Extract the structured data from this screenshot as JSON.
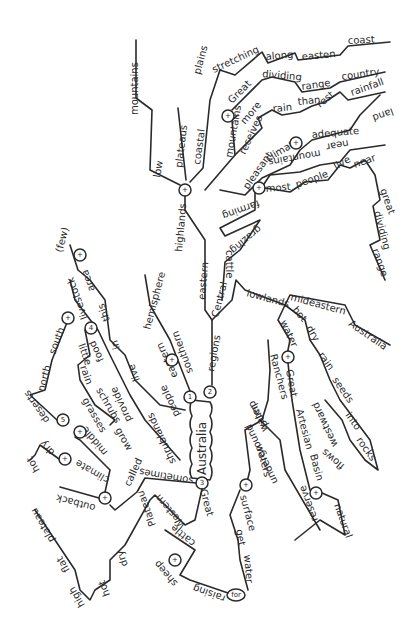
{
  "center": "Australia",
  "branches": {
    "b1": {
      "node": "1",
      "words": [
        "eastern",
        "southern",
        "hemisphere",
        "people",
        "live",
        "in",
        "this",
        "area",
        "(few)",
        "shrublands",
        "provide",
        "food",
        "livestock",
        "little",
        "rain",
        "grasses",
        "schrubs",
        "grow"
      ]
    },
    "b2": {
      "node": "2",
      "words": [
        "regions",
        "eastern",
        "highlands",
        "low",
        "mountains",
        "plateaus",
        "coastal",
        "mountains",
        "plains",
        "stretching",
        "along",
        "easten",
        "coast",
        "Great",
        "dividing",
        "range",
        "receives",
        "more",
        "rain",
        "than",
        "rest",
        "country",
        "pleasant",
        "climate",
        "adequate",
        "rainfall",
        "land",
        "near",
        "mountains",
        "most",
        "people",
        "live",
        "near",
        "great",
        "dividing",
        "range",
        "farming",
        "grazing",
        "cattle",
        "Central",
        "lowlands",
        "mideastern",
        "Australia",
        "hot",
        "dry",
        "rain",
        "seeds",
        "into",
        "rocks",
        "flows",
        "westward",
        "water",
        "Great",
        "Artesian",
        "Basin",
        "natural",
        "reserve",
        "underground",
        "water",
        "Ranchers",
        "pump",
        "waters",
        "surface",
        "get",
        "water",
        "for"
      ]
    },
    "b3": {
      "node": "3",
      "words": [
        "sometimes",
        "called",
        "outback",
        "climate",
        "middle",
        "hot",
        "dry",
        "deserts",
        "north",
        "south",
        "Great",
        "Western",
        "Plateau",
        "dry",
        "hot",
        "high",
        "flat",
        "plateau",
        "cattle",
        "sheep",
        "raising"
      ]
    }
  },
  "labels": {
    "australia": "Australia",
    "eastern1": "eastern",
    "southern": "southern",
    "hemisphere": "hemisphere",
    "people": "people",
    "live1": "live",
    "in": "in",
    "this": "this",
    "area": "area",
    "few": "(few)",
    "shrublands": "shrublands",
    "provide": "provide",
    "food": "food",
    "livestock": "livestock",
    "little": "little",
    "rain1": "rain",
    "grasses": "grasses",
    "schrubs": "schrubs",
    "grow": "grow",
    "north": "north",
    "south": "south",
    "deserts": "deserts",
    "middle": "middle",
    "climate1": "climate",
    "hot1": "hot",
    "dry1": "dry",
    "outback": "outback",
    "called": "called",
    "sometimes": "sometimes",
    "regions": "regions",
    "eastern2": "eastern",
    "highlands": "highlands",
    "low": "low",
    "mountains1": "mountains",
    "plateaus": "plateaus",
    "coastal": "coastal",
    "mountains2": "mountains",
    "plains": "plains",
    "stretching": "stretching",
    "along": "along",
    "easten": "easten",
    "coast": "coast",
    "great1": "Great",
    "dividing1": "dividing",
    "range1": "range",
    "receives": "receives",
    "more": "more",
    "rain2": "rain",
    "than": "than",
    "rest": "rest",
    "country": "country",
    "pleasant": "pleasant",
    "climate2": "climate",
    "adequate": "adequate",
    "rainfall": "rainfall",
    "land": "land",
    "near1": "near",
    "mountains3": "mountains",
    "most": "most",
    "people2": "people",
    "live2": "live",
    "near2": "near",
    "great2": "great",
    "dividing2": "dividing",
    "range2": "range",
    "farming": "farming",
    "grazing": "grazing",
    "cattle1": "cattle",
    "central": "Central",
    "lowlands": "lowlands",
    "mideastern": "mideastern",
    "australia2": "Australia",
    "hot2": "hot",
    "dry2": "dry",
    "rain3": "rain",
    "seeds": "seeds",
    "into": "into",
    "rocks": "rocks",
    "flows": "flows",
    "westward": "westward",
    "water1": "water",
    "great3": "Great",
    "artesian": "Artesian",
    "basin": "Basin",
    "natural": "natural",
    "reserve": "reserve",
    "underground": "underground",
    "water2": "water",
    "ranchers": "Ranchers",
    "pump": "pump",
    "waters": "waters",
    "surface": "surface",
    "get": "get",
    "water3": "water",
    "for": "for",
    "raising": "raising",
    "sheep": "sheep",
    "cattle2": "cattle",
    "great4": "Great",
    "western": "Western",
    "plateau": "Plateau",
    "dry3": "dry",
    "hot3": "hot",
    "high": "high",
    "flat": "flat",
    "plateau2": "plateau"
  },
  "nodes": {
    "n1": "1",
    "n2": "2",
    "n3": "3",
    "n4": "4",
    "n5": "5",
    "n6": "6",
    "plus": "+",
    "for": "for"
  }
}
